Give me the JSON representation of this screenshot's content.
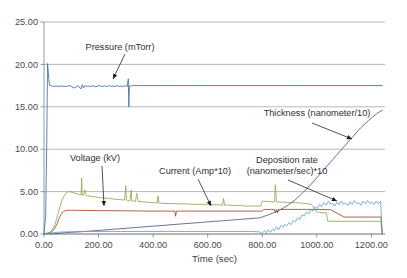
{
  "chart_data": {
    "type": "line",
    "title": "",
    "xlabel": "Time (sec)",
    "ylabel": "",
    "xlim": [
      0,
      1250
    ],
    "ylim": [
      0,
      25
    ],
    "grid": true,
    "legend_position": "inline-annotations",
    "x_ticks": [
      "0.00",
      "200.00",
      "400.00",
      "600.00",
      "800.00",
      "1000.00",
      "1200.00"
    ],
    "x_tick_values": [
      0,
      200,
      400,
      600,
      800,
      1000,
      1200
    ],
    "y_ticks": [
      "0.00",
      "5.00",
      "10.00",
      "15.00",
      "20.00",
      "25.00"
    ],
    "y_tick_values": [
      0,
      5,
      10,
      15,
      20,
      25
    ],
    "annotations": [
      {
        "id": "pressure",
        "text_line1": "Pressure (mTorr)",
        "text_line2": ""
      },
      {
        "id": "thickness",
        "text_line1": "Thickness (nanometer/10)",
        "text_line2": ""
      },
      {
        "id": "voltage",
        "text_line1": "Voltage (kV)",
        "text_line2": ""
      },
      {
        "id": "current",
        "text_line1": "Current (Amp*10)",
        "text_line2": ""
      },
      {
        "id": "deposition",
        "text_line1": "Deposition rate",
        "text_line2": "(nanometer/sec)*10"
      }
    ],
    "series": [
      {
        "name": "Pressure (mTorr)",
        "color": "#3d6ea8",
        "x": [
          0,
          6,
          10,
          13,
          16,
          19,
          22,
          26,
          30,
          36,
          44,
          54,
          66,
          80,
          95,
          110,
          125,
          135,
          140,
          145,
          150,
          158,
          165,
          172,
          180,
          190,
          200,
          210,
          222,
          232,
          240,
          248,
          255,
          262,
          268,
          275,
          282,
          290,
          298,
          305,
          309,
          311,
          313,
          315,
          318,
          322,
          330,
          345,
          365,
          400,
          450,
          520,
          600,
          700,
          800,
          900,
          1000,
          1100,
          1200,
          1240
        ],
        "y": [
          0.1,
          2.0,
          10.5,
          20.1,
          19.0,
          17.8,
          17.5,
          17.5,
          17.45,
          17.4,
          17.45,
          17.4,
          17.45,
          17.4,
          17.5,
          17.2,
          17.5,
          17.1,
          17.6,
          17.2,
          17.5,
          17.4,
          17.45,
          17.4,
          17.5,
          17.35,
          17.5,
          17.4,
          17.45,
          17.4,
          17.5,
          17.4,
          17.45,
          17.4,
          17.5,
          17.4,
          17.45,
          17.4,
          17.5,
          17.4,
          18.3,
          15.0,
          17.3,
          17.5,
          17.45,
          17.5,
          17.5,
          17.5,
          17.5,
          17.5,
          17.5,
          17.5,
          17.5,
          17.5,
          17.5,
          17.5,
          17.5,
          17.5,
          17.5,
          17.5
        ]
      },
      {
        "name": "Current (Amp*10)",
        "color": "#8faa56",
        "x": [
          0,
          10,
          20,
          30,
          40,
          50,
          58,
          66,
          74,
          82,
          90,
          100,
          110,
          120,
          130,
          136,
          138,
          140,
          145,
          150,
          155,
          160,
          170,
          185,
          200,
          220,
          240,
          260,
          280,
          295,
          300,
          302,
          305,
          315,
          320,
          322,
          325,
          335,
          340,
          345,
          360,
          380,
          400,
          415,
          418,
          422,
          440,
          470,
          500,
          520,
          540,
          560,
          580,
          600,
          620,
          640,
          655,
          658,
          662,
          680,
          700,
          720,
          740,
          760,
          780,
          795,
          800,
          805,
          820,
          835,
          845,
          848,
          852,
          865,
          880,
          900,
          920,
          940,
          960,
          980,
          1000,
          1010,
          1020,
          1035,
          1040,
          1060,
          1080,
          1120,
          1160,
          1200,
          1235,
          1240
        ],
        "y": [
          0.05,
          0.1,
          0.2,
          0.5,
          1.1,
          2.2,
          3.2,
          4.0,
          4.5,
          4.85,
          5.0,
          4.95,
          4.85,
          4.75,
          4.65,
          4.6,
          6.6,
          4.6,
          4.55,
          5.2,
          4.55,
          4.5,
          4.45,
          4.4,
          4.3,
          4.25,
          4.2,
          4.1,
          4.05,
          4.0,
          5.7,
          4.0,
          3.95,
          3.9,
          5.2,
          3.9,
          3.9,
          3.85,
          4.8,
          3.85,
          3.8,
          3.75,
          3.7,
          3.65,
          4.5,
          3.65,
          3.6,
          3.6,
          3.55,
          3.55,
          3.5,
          3.5,
          3.5,
          3.5,
          3.45,
          3.45,
          3.4,
          4.2,
          3.4,
          3.4,
          3.35,
          3.35,
          3.3,
          3.3,
          3.3,
          3.3,
          3.9,
          3.85,
          3.85,
          3.8,
          3.8,
          5.8,
          3.8,
          3.75,
          3.75,
          3.7,
          3.7,
          3.65,
          3.6,
          3.5,
          2.6,
          2.55,
          2.5,
          2.5,
          1.5,
          1.5,
          1.5,
          1.5,
          1.5,
          1.5,
          1.5,
          0.05
        ]
      },
      {
        "name": "Voltage (kV)",
        "color": "#a8452e",
        "x": [
          0,
          10,
          20,
          30,
          40,
          48,
          55,
          62,
          70,
          78,
          85,
          92,
          100,
          115,
          130,
          150,
          180,
          220,
          260,
          300,
          340,
          380,
          420,
          460,
          480,
          482,
          486,
          500,
          540,
          580,
          620,
          660,
          700,
          740,
          780,
          795,
          800,
          805,
          830,
          845,
          848,
          852,
          856,
          860,
          864,
          880,
          900,
          920,
          960,
          1000,
          1050,
          1100,
          1150,
          1200,
          1235,
          1240
        ],
        "y": [
          0.02,
          0.05,
          0.12,
          0.3,
          0.7,
          1.2,
          1.8,
          2.3,
          2.6,
          2.75,
          2.8,
          2.8,
          2.8,
          2.8,
          2.78,
          2.78,
          2.76,
          2.75,
          2.74,
          2.73,
          2.72,
          2.7,
          2.7,
          2.7,
          2.7,
          2.1,
          2.7,
          2.7,
          2.7,
          2.7,
          2.7,
          2.7,
          2.7,
          2.7,
          2.7,
          2.7,
          2.72,
          2.9,
          2.9,
          2.9,
          2.5,
          2.9,
          2.5,
          2.9,
          2.9,
          2.9,
          2.9,
          2.9,
          2.9,
          2.9,
          2.88,
          2.0,
          2.0,
          2.0,
          2.0,
          0.02
        ]
      },
      {
        "name": "Thickness (nanometer/10)",
        "color": "#5b5580",
        "x": [
          0,
          20,
          40,
          60,
          80,
          100,
          140,
          200,
          260,
          320,
          380,
          440,
          500,
          560,
          620,
          680,
          740,
          790,
          800,
          830,
          860,
          890,
          920,
          950,
          980,
          1010,
          1040,
          1070,
          1100,
          1130,
          1160,
          1190,
          1220,
          1240
        ],
        "y": [
          0.02,
          0.03,
          0.05,
          0.1,
          0.15,
          0.2,
          0.28,
          0.42,
          0.58,
          0.72,
          0.88,
          1.02,
          1.18,
          1.32,
          1.48,
          1.62,
          1.78,
          1.9,
          2.0,
          2.35,
          2.75,
          3.3,
          4.0,
          4.9,
          5.9,
          7.0,
          8.1,
          9.2,
          10.3,
          11.4,
          12.5,
          13.4,
          14.2,
          14.6
        ]
      },
      {
        "name": "Deposition rate (nanometer/sec)*10",
        "color": "#5aa9c4",
        "x": [
          0,
          25,
          50,
          80,
          120,
          170,
          220,
          280,
          340,
          400,
          460,
          520,
          580,
          640,
          700,
          760,
          790,
          800,
          808,
          815,
          822,
          830,
          838,
          845,
          852,
          860,
          868,
          875,
          882,
          890,
          898,
          906,
          914,
          922,
          930,
          938,
          946,
          954,
          962,
          970,
          978,
          986,
          994,
          1002,
          1010,
          1018,
          1026,
          1034,
          1042,
          1050,
          1058,
          1066,
          1074,
          1082,
          1090,
          1098,
          1106,
          1114,
          1122,
          1130,
          1138,
          1146,
          1154,
          1162,
          1170,
          1178,
          1186,
          1194,
          1202,
          1210,
          1218,
          1226,
          1234,
          1240
        ],
        "y": [
          0.02,
          0.1,
          0.2,
          0.25,
          0.28,
          0.3,
          0.3,
          0.3,
          0.3,
          0.3,
          0.3,
          0.3,
          0.3,
          0.3,
          0.3,
          0.3,
          0.25,
          0.05,
          0.4,
          0.15,
          0.5,
          0.2,
          0.6,
          0.35,
          0.85,
          0.5,
          1.0,
          0.75,
          1.15,
          0.95,
          1.35,
          1.1,
          1.6,
          1.45,
          1.9,
          1.7,
          2.3,
          2.1,
          2.6,
          2.35,
          2.9,
          2.7,
          3.2,
          3.0,
          3.5,
          3.25,
          3.7,
          3.4,
          3.85,
          3.55,
          3.6,
          3.3,
          3.75,
          3.45,
          3.9,
          3.5,
          3.65,
          3.35,
          3.8,
          3.5,
          3.95,
          3.6,
          3.7,
          3.4,
          3.85,
          3.55,
          3.95,
          3.6,
          3.75,
          3.45,
          3.9,
          3.55,
          3.85,
          0.05
        ]
      }
    ]
  }
}
